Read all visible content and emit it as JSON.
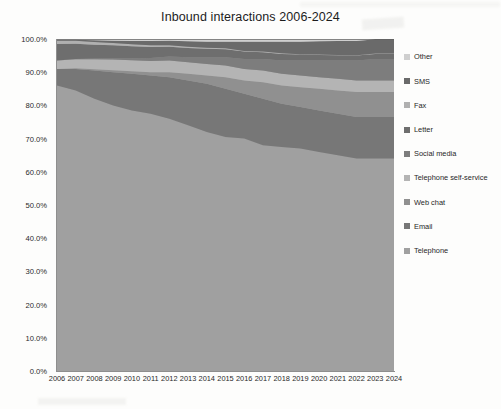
{
  "chart_data": {
    "type": "area",
    "stacked": true,
    "stack_mode": "percent",
    "title": "Inbound interactions 2006-2024",
    "xlabel": "",
    "ylabel": "",
    "ylim": [
      0,
      100
    ],
    "ytick_labels": [
      "0.0%",
      "10.0%",
      "20.0%",
      "30.0%",
      "40.0%",
      "50.0%",
      "60.0%",
      "70.0%",
      "80.0%",
      "90.0%",
      "100.0%"
    ],
    "ytick_values": [
      0,
      10,
      20,
      30,
      40,
      50,
      60,
      70,
      80,
      90,
      100
    ],
    "grid": false,
    "legend_position": "right",
    "categories": [
      "2006",
      "2007",
      "2008",
      "2009",
      "2010",
      "2011",
      "2012",
      "2013",
      "2014",
      "2015",
      "2016",
      "2017",
      "2018",
      "2019",
      "2020",
      "2021",
      "2022",
      "2023",
      "2024"
    ],
    "series": [
      {
        "name": "Telephone",
        "color": "#a0a0a0",
        "values": [
          86.0,
          84.5,
          82.0,
          80.0,
          78.5,
          77.5,
          76.0,
          74.0,
          72.0,
          70.5,
          70.0,
          68.0,
          67.5,
          67.0,
          66.0,
          65.0,
          64.0,
          64.0,
          64.0
        ]
      },
      {
        "name": "Email",
        "color": "#777777",
        "values": [
          5.0,
          6.5,
          8.5,
          10.0,
          11.0,
          11.5,
          12.5,
          13.5,
          14.5,
          14.5,
          13.5,
          14.0,
          13.0,
          12.5,
          12.5,
          12.5,
          12.5,
          12.5,
          12.5
        ]
      },
      {
        "name": "Web chat",
        "color": "#909090",
        "values": [
          0.0,
          0.2,
          0.4,
          0.6,
          0.8,
          1.0,
          1.5,
          2.0,
          2.5,
          3.5,
          4.0,
          5.0,
          5.5,
          6.0,
          6.5,
          7.0,
          7.5,
          7.5,
          7.5
        ]
      },
      {
        "name": "Telephone self-service",
        "color": "#b4b4b4",
        "values": [
          2.5,
          2.7,
          3.0,
          3.2,
          3.3,
          3.4,
          3.5,
          3.5,
          3.5,
          3.5,
          3.5,
          3.5,
          3.5,
          3.5,
          3.5,
          3.5,
          3.5,
          3.5,
          3.5
        ]
      },
      {
        "name": "Social media",
        "color": "#7d7d7d",
        "values": [
          0.0,
          0.1,
          0.2,
          0.4,
          0.6,
          0.9,
          1.2,
          1.5,
          2.0,
          2.5,
          3.0,
          3.5,
          4.0,
          4.5,
          5.0,
          5.5,
          6.0,
          6.5,
          6.5
        ]
      },
      {
        "name": "Letter",
        "color": "#6e6e6e",
        "values": [
          5.0,
          4.6,
          4.2,
          3.9,
          3.6,
          3.3,
          3.0,
          2.8,
          2.6,
          2.4,
          2.2,
          2.0,
          2.0,
          1.8,
          1.7,
          1.6,
          1.5,
          1.5,
          1.5
        ]
      },
      {
        "name": "Fax",
        "color": "#b0b0b0",
        "values": [
          1.0,
          0.9,
          0.8,
          0.7,
          0.6,
          0.5,
          0.4,
          0.4,
          0.3,
          0.3,
          0.2,
          0.2,
          0.2,
          0.1,
          0.1,
          0.1,
          0.1,
          0.1,
          0.1
        ]
      },
      {
        "name": "SMS",
        "color": "#6a6a6a",
        "values": [
          0.3,
          0.3,
          0.5,
          0.7,
          1.0,
          1.3,
          1.4,
          1.6,
          1.8,
          2.0,
          2.8,
          3.0,
          3.5,
          3.8,
          4.0,
          4.2,
          4.3,
          4.3,
          4.3
        ]
      },
      {
        "name": "Other",
        "color": "#cfcfcf",
        "values": [
          0.2,
          0.2,
          0.4,
          0.5,
          0.6,
          0.6,
          0.5,
          0.7,
          0.8,
          0.8,
          0.8,
          0.8,
          0.8,
          0.8,
          0.7,
          0.6,
          0.6,
          0.1,
          0.1
        ]
      }
    ],
    "legend_order": [
      "Other",
      "SMS",
      "Fax",
      "Letter",
      "Social media",
      "Telephone self-service",
      "Web chat",
      "Email",
      "Telephone"
    ]
  },
  "legend": {
    "items": [
      {
        "label": "Other",
        "color": "#cfcfcf"
      },
      {
        "label": "SMS",
        "color": "#6a6a6a"
      },
      {
        "label": "Fax",
        "color": "#b0b0b0"
      },
      {
        "label": "Letter",
        "color": "#6e6e6e"
      },
      {
        "label": "Social media",
        "color": "#7d7d7d"
      },
      {
        "label": "Telephone self-service",
        "color": "#b4b4b4"
      },
      {
        "label": "Web chat",
        "color": "#909090"
      },
      {
        "label": "Email",
        "color": "#777777"
      },
      {
        "label": "Telephone",
        "color": "#a0a0a0"
      }
    ]
  }
}
